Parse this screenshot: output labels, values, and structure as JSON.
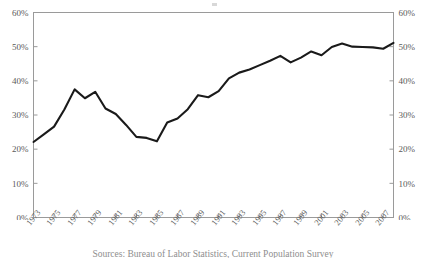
{
  "figure": {
    "top_mark": "",
    "caption_partial": "Sources: Bureau of Labor Statistics, Current Population Survey"
  },
  "axes": {
    "left_ticks": [
      "0%",
      "10%",
      "20%",
      "30%",
      "40%",
      "50%",
      "60%"
    ],
    "right_ticks": [
      "0%",
      "10%",
      "20%",
      "30%",
      "40%",
      "50%",
      "60%"
    ],
    "x_ticks": [
      "1973",
      "1975",
      "1977",
      "1979",
      "1981",
      "1983",
      "1985",
      "1987",
      "1989",
      "1991",
      "1993",
      "1995",
      "1997",
      "1999",
      "2001",
      "2003",
      "2005",
      "2007"
    ]
  },
  "colors": {
    "line": "#1a1a1a",
    "frame": "#9a9a9a",
    "tick_text": "#5a5a5a",
    "background": "#ffffff"
  },
  "chart_data": {
    "type": "line",
    "title": "",
    "subtitle": "",
    "xlabel": "",
    "ylabel": "",
    "ylim": [
      0,
      60
    ],
    "xlim": [
      1973,
      2008
    ],
    "ytick_values": [
      0,
      10,
      20,
      30,
      40,
      50,
      60
    ],
    "ytick_labels": [
      "0%",
      "10%",
      "20%",
      "30%",
      "40%",
      "50%",
      "60%"
    ],
    "y_axis_both_sides": true,
    "xtick_values": [
      1973,
      1975,
      1977,
      1979,
      1981,
      1983,
      1985,
      1987,
      1989,
      1991,
      1993,
      1995,
      1997,
      1999,
      2001,
      2003,
      2005,
      2007
    ],
    "xtick_label_rotation": -52,
    "grid": false,
    "legend": false,
    "legend_position": "none",
    "x": [
      1973,
      1974,
      1975,
      1976,
      1977,
      1978,
      1979,
      1980,
      1981,
      1982,
      1983,
      1984,
      1985,
      1986,
      1987,
      1988,
      1989,
      1990,
      1991,
      1992,
      1993,
      1994,
      1995,
      1996,
      1997,
      1998,
      1999,
      2000,
      2001,
      2002,
      2003,
      2004,
      2005,
      2006,
      2007,
      2008
    ],
    "series": [
      {
        "name": "Share",
        "units": "percent",
        "values": [
          22.1,
          24.3,
          26.6,
          31.6,
          37.5,
          34.9,
          36.8,
          31.9,
          30.3,
          27.1,
          23.6,
          23.3,
          22.3,
          27.8,
          29.0,
          31.7,
          35.8,
          35.2,
          37.0,
          40.7,
          42.4,
          43.3,
          44.6,
          45.9,
          47.3,
          45.4,
          46.8,
          48.6,
          47.5,
          49.9,
          50.9,
          50.0,
          49.9,
          49.8,
          49.4,
          51.1
        ]
      }
    ]
  }
}
